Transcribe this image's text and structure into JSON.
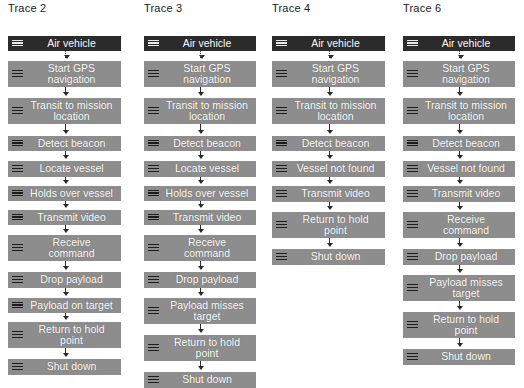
{
  "diagram": {
    "background_color": "#ffffff",
    "node_color": "#8d8d8d",
    "start_node_color": "#2b2b2b",
    "text_color": "#ffffff",
    "connector_color": "#2a2a2a",
    "icon_name": "activity-lines-icon"
  },
  "traces": [
    {
      "title": "Trace 2",
      "left": 8,
      "width": 113,
      "nodes": [
        {
          "label": "Air vehicle",
          "style": "dark",
          "top": 20,
          "height": 15,
          "connector": "dotted"
        },
        {
          "label": "Start GPS\nnavigation",
          "style": "normal",
          "top": 45,
          "height": 26,
          "connector": "solid"
        },
        {
          "label": "Transit to mission\nlocation",
          "style": "normal",
          "top": 82,
          "height": 26,
          "connector": "solid"
        },
        {
          "label": "Detect beacon",
          "style": "normal",
          "top": 120,
          "height": 15,
          "connector": "solid"
        },
        {
          "label": "Locate vessel",
          "style": "normal",
          "top": 145,
          "height": 16,
          "connector": "solid"
        },
        {
          "label": "Holds over vessel",
          "style": "normal",
          "top": 170,
          "height": 15,
          "connector": "solid"
        },
        {
          "label": "Transmit video",
          "style": "normal",
          "top": 194,
          "height": 15,
          "connector": "solid"
        },
        {
          "label": "Receive\ncommand",
          "style": "normal",
          "top": 219,
          "height": 26,
          "connector": "solid"
        },
        {
          "label": "Drop payload",
          "style": "normal",
          "top": 256,
          "height": 16,
          "connector": "solid"
        },
        {
          "label": "Payload on target",
          "style": "normal",
          "top": 282,
          "height": 15,
          "connector": "solid"
        },
        {
          "label": "Return to hold\npoint",
          "style": "normal",
          "top": 306,
          "height": 26,
          "connector": "solid"
        },
        {
          "label": "Shut down",
          "style": "normal",
          "top": 343,
          "height": 16,
          "connector": "none"
        }
      ]
    },
    {
      "title": "Trace 3",
      "left": 144,
      "width": 112,
      "nodes": [
        {
          "label": "Air vehicle",
          "style": "dark",
          "top": 20,
          "height": 15,
          "connector": "dotted"
        },
        {
          "label": "Start GPS\nnavigation",
          "style": "normal",
          "top": 45,
          "height": 26,
          "connector": "solid"
        },
        {
          "label": "Transit to mission\nlocation",
          "style": "normal",
          "top": 82,
          "height": 26,
          "connector": "solid"
        },
        {
          "label": "Detect beacon",
          "style": "normal",
          "top": 120,
          "height": 15,
          "connector": "solid"
        },
        {
          "label": "Locate vessel",
          "style": "normal",
          "top": 145,
          "height": 16,
          "connector": "solid"
        },
        {
          "label": "Holds over vessel",
          "style": "normal",
          "top": 170,
          "height": 15,
          "connector": "solid"
        },
        {
          "label": "Transmit video",
          "style": "normal",
          "top": 194,
          "height": 15,
          "connector": "solid"
        },
        {
          "label": "Receive\ncommand",
          "style": "normal",
          "top": 219,
          "height": 26,
          "connector": "solid"
        },
        {
          "label": "Drop payload",
          "style": "normal",
          "top": 256,
          "height": 16,
          "connector": "solid"
        },
        {
          "label": "Payload misses\ntarget",
          "style": "normal",
          "top": 282,
          "height": 26,
          "connector": "solid"
        },
        {
          "label": "Return to hold\npoint",
          "style": "normal",
          "top": 319,
          "height": 26,
          "connector": "solid"
        },
        {
          "label": "Shut down",
          "style": "normal",
          "top": 356,
          "height": 16,
          "connector": "none"
        }
      ]
    },
    {
      "title": "Trace 4",
      "left": 272,
      "width": 113,
      "nodes": [
        {
          "label": "Air vehicle",
          "style": "dark",
          "top": 20,
          "height": 15,
          "connector": "dotted"
        },
        {
          "label": "Start GPS\nnavigation",
          "style": "normal",
          "top": 45,
          "height": 26,
          "connector": "solid"
        },
        {
          "label": "Transit to mission\nlocation",
          "style": "normal",
          "top": 82,
          "height": 26,
          "connector": "solid"
        },
        {
          "label": "Detect beacon",
          "style": "normal",
          "top": 120,
          "height": 15,
          "connector": "solid"
        },
        {
          "label": "Vessel not found",
          "style": "normal",
          "top": 145,
          "height": 16,
          "connector": "solid"
        },
        {
          "label": "Transmit video",
          "style": "normal",
          "top": 170,
          "height": 16,
          "connector": "solid"
        },
        {
          "label": "Return to hold\npoint",
          "style": "normal",
          "top": 196,
          "height": 26,
          "connector": "solid"
        },
        {
          "label": "Shut down",
          "style": "normal",
          "top": 233,
          "height": 16,
          "connector": "none"
        }
      ]
    },
    {
      "title": "Trace 6",
      "left": 403,
      "width": 112,
      "nodes": [
        {
          "label": "Air vehicle",
          "style": "dark",
          "top": 20,
          "height": 15,
          "connector": "dotted"
        },
        {
          "label": "Start GPS\nnavigation",
          "style": "normal",
          "top": 45,
          "height": 26,
          "connector": "solid"
        },
        {
          "label": "Transit to mission\nlocation",
          "style": "normal",
          "top": 82,
          "height": 26,
          "connector": "solid"
        },
        {
          "label": "Detect beacon",
          "style": "normal",
          "top": 120,
          "height": 15,
          "connector": "solid"
        },
        {
          "label": "Vessel not found",
          "style": "normal",
          "top": 145,
          "height": 16,
          "connector": "solid"
        },
        {
          "label": "Transmit video",
          "style": "normal",
          "top": 170,
          "height": 16,
          "connector": "solid"
        },
        {
          "label": "Receive\ncommand",
          "style": "normal",
          "top": 196,
          "height": 26,
          "connector": "solid"
        },
        {
          "label": "Drop payload",
          "style": "normal",
          "top": 233,
          "height": 16,
          "connector": "solid"
        },
        {
          "label": "Payload misses\ntarget",
          "style": "normal",
          "top": 259,
          "height": 26,
          "connector": "solid"
        },
        {
          "label": "Return to hold\npoint",
          "style": "normal",
          "top": 296,
          "height": 26,
          "connector": "solid"
        },
        {
          "label": "Shut down",
          "style": "normal",
          "top": 333,
          "height": 16,
          "connector": "none"
        }
      ]
    }
  ]
}
